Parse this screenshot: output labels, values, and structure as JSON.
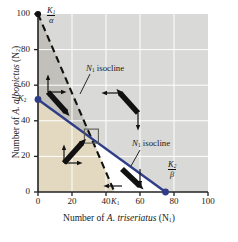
{
  "chart_data": {
    "type": "line",
    "title": "",
    "xlabel": "Number of A. triseriatus (N1)",
    "ylabel": "Number of A. albopictus (N2)",
    "xlim": [
      0,
      100
    ],
    "ylim": [
      0,
      100
    ],
    "xticks": [
      0,
      20,
      40,
      60,
      80,
      100
    ],
    "yticks": [
      0,
      20,
      40,
      60,
      80,
      100
    ],
    "grid": true,
    "legend": "none",
    "series": [
      {
        "name": "N1 isocline",
        "style": "dashed",
        "color": "#111111",
        "x": [
          0,
          45
        ],
        "y": [
          100,
          0
        ],
        "intercepts": {
          "y_axis": 100,
          "x_axis": 45
        },
        "intercept_labels": {
          "y_axis": "K1/alpha",
          "x_axis": "K1"
        }
      },
      {
        "name": "N2 isocline",
        "style": "solid",
        "color": "#2f3d86",
        "x": [
          0,
          75
        ],
        "y": [
          52,
          0
        ],
        "intercepts": {
          "y_axis": 52,
          "x_axis": 75
        },
        "intercept_labels": {
          "y_axis": "K2",
          "x_axis": "K2/beta"
        }
      }
    ],
    "equilibrium_point": {
      "x": 31,
      "y": 31,
      "marker": "open-square"
    },
    "points": [
      {
        "x": 0,
        "y": 100,
        "color": "#111111",
        "label": "K1/alpha"
      },
      {
        "x": 0,
        "y": 52,
        "color": "#2f3d86",
        "label": "K2"
      },
      {
        "x": 75,
        "y": 0,
        "color": "#2f3d86",
        "label": "K2/beta"
      }
    ],
    "regions": [
      {
        "name": "upper-left-wedge",
        "color": "#c2c0bb",
        "description": "between N2 isocline and N1 isocline, upper left"
      },
      {
        "name": "lower-left-region",
        "color": "#e2d9c0",
        "description": "below both isoclines"
      },
      {
        "name": "lower-right-wedge",
        "color": "#ffffff",
        "description": "between N1 isocline and N2 isocline, lower right"
      },
      {
        "name": "outer-region",
        "color": "#d9d9d7",
        "description": "above both isoclines"
      }
    ],
    "vector_arrows": [
      {
        "region": "lower-left-region",
        "direction": "up-right",
        "cx": 40,
        "cy": 19
      },
      {
        "region": "upper-left-wedge",
        "direction": "down-right",
        "cx": 9,
        "cy": 62
      },
      {
        "region": "outer-region-upper",
        "direction": "down-left",
        "cx": 52,
        "cy": 43
      },
      {
        "region": "lower-right-wedge",
        "direction": "down-right",
        "cx": 53,
        "cy": 6
      }
    ]
  },
  "labels": {
    "y_axis_title": "Number of A. albopictus (N",
    "y_axis_title_sub": "2",
    "y_axis_title_end": ")",
    "x_axis_title": "Number of A. triseriatus (N",
    "x_axis_title_sub": "1",
    "x_axis_title_end": ")",
    "n1_isocline": "isocline",
    "n2_isocline": "isocline",
    "n1_symbol": "N",
    "n1_sub": "1",
    "n2_symbol": "N",
    "n2_sub": "1",
    "k1_over_alpha_num": "K",
    "k1_over_alpha_num_sub": "1",
    "k1_over_alpha_den": "α",
    "k2_over_beta_num": "K",
    "k2_over_beta_num_sub": "2",
    "k2_over_beta_den": "β",
    "k1_label": "K",
    "k1_label_sub": "1",
    "k2_label": "K",
    "k2_label_sub": "2"
  },
  "ticks": {
    "x": [
      "0",
      "20",
      "40",
      "60",
      "80",
      "100"
    ],
    "y": [
      "0",
      "20",
      "40",
      "60",
      "80",
      "100"
    ]
  },
  "colors": {
    "plot_bg": "#d9d9d7",
    "region_tan": "#e2d9c0",
    "region_gray": "#c2c0bb",
    "region_white": "#ffffff",
    "isocline_n2": "#2f3d86",
    "isocline_n1": "#111111",
    "gridline": "#ffffff",
    "axis": "#222222"
  }
}
